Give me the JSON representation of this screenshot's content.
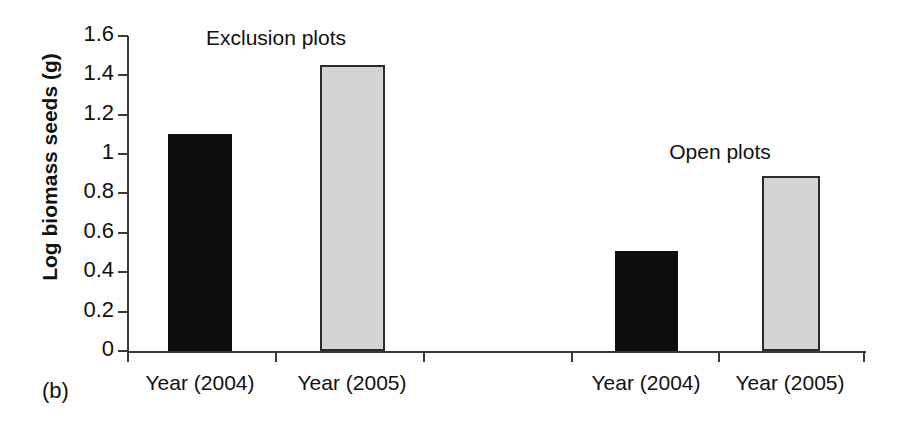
{
  "panel_label": "(b)",
  "chart_data": {
    "type": "bar",
    "title": "",
    "xlabel": "",
    "ylabel": "Log biomass seeds (g)",
    "ylim": [
      0,
      1.6
    ],
    "ytick_labels": [
      "0",
      "0.2",
      "0.4",
      "0.6",
      "0.8",
      "1",
      "1.2",
      "1.4",
      "1.6"
    ],
    "ytick_values": [
      0,
      0.2,
      0.4,
      0.6,
      0.8,
      1,
      1.2,
      1.4,
      1.6
    ],
    "grid": false,
    "legend": "none",
    "categories": [
      "Year (2004)",
      "Year (2005)",
      "Year (2004)",
      "Year (2005)"
    ],
    "values": [
      1.1,
      1.45,
      0.51,
      0.89
    ],
    "groups": [
      {
        "name": "Exclusion plots",
        "bars": [
          {
            "label": "Year (2004)",
            "value": 1.1,
            "color": "#0d0d0d",
            "style": "dark"
          },
          {
            "label": "Year (2005)",
            "value": 1.45,
            "color": "#d4d4d4",
            "style": "light"
          }
        ]
      },
      {
        "name": "Open plots",
        "bars": [
          {
            "label": "Year (2004)",
            "value": 0.51,
            "color": "#0d0d0d",
            "style": "dark"
          },
          {
            "label": "Year (2005)",
            "value": 0.89,
            "color": "#d4d4d4",
            "style": "light"
          }
        ]
      }
    ],
    "annotations": [
      {
        "text": "Exclusion plots",
        "x_px": 276,
        "y_px": 26
      },
      {
        "text": "Open plots",
        "x_px": 720,
        "y_px": 140
      }
    ]
  },
  "colors": {
    "axis": "#3a3a3a",
    "text": "#111111",
    "bar_dark": "#0d0d0d",
    "bar_light": "#d4d4d4",
    "bar_light_border": "#2b2b2b",
    "background": "#ffffff"
  },
  "geometry": {
    "plot_left": 127,
    "plot_right": 866,
    "baseline_y": 351,
    "top_y": 36,
    "px_per_unit": 196.9,
    "x_ticks": [
      127,
      275,
      423,
      571,
      718,
      863
    ],
    "bars_px": [
      {
        "left": 168,
        "width": 64,
        "top": 135
      },
      {
        "left": 320,
        "width": 65,
        "top": 68
      },
      {
        "left": 615,
        "width": 63,
        "top": 253
      },
      {
        "left": 762,
        "width": 58,
        "top": 181
      }
    ],
    "label_centers": [
      200,
      352,
      646,
      790
    ]
  }
}
